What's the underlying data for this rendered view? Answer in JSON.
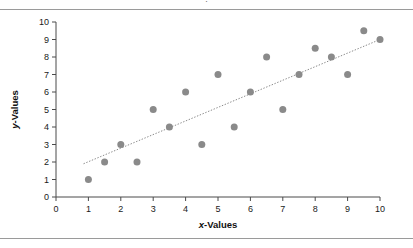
{
  "figure": {
    "clipped_header_text": "·",
    "background_color": "#ffffff",
    "rule_color": "#9a9a9a"
  },
  "chart_data": {
    "type": "scatter",
    "title": "",
    "subtitle": "",
    "xlabel": "x-Values",
    "ylabel": "y-Values",
    "xlabel_parts": {
      "italic": "x",
      "rest": "-Values"
    },
    "ylabel_parts": {
      "italic": "y",
      "rest": "-Values"
    },
    "xlim": [
      0,
      10
    ],
    "ylim": [
      0,
      10
    ],
    "xticks": [
      0,
      1,
      2,
      3,
      4,
      5,
      6,
      7,
      8,
      9,
      10
    ],
    "yticks": [
      0,
      1,
      2,
      3,
      4,
      5,
      6,
      7,
      8,
      9,
      10
    ],
    "xtick_labels": [
      "0",
      "1",
      "2",
      "3",
      "4",
      "5",
      "6",
      "7",
      "8",
      "9",
      "10"
    ],
    "ytick_labels": [
      "0",
      "1",
      "2",
      "3",
      "4",
      "5",
      "6",
      "7",
      "8",
      "9",
      "10"
    ],
    "grid": false,
    "legend": false,
    "legend_position": "none",
    "marker_color": "#8a8a8a",
    "marker_size": 4.6,
    "series": [
      {
        "name": "data",
        "x": [
          1,
          1.5,
          2,
          2.5,
          3,
          3.5,
          4,
          4.5,
          5,
          5.5,
          6,
          6.5,
          7,
          7.5,
          8,
          8.5,
          9,
          9.5,
          10
        ],
        "y": [
          1,
          2,
          3,
          2,
          5,
          4,
          6,
          3,
          7,
          4,
          6,
          8,
          5,
          7,
          8.5,
          8,
          7,
          9.5,
          9
        ]
      }
    ],
    "trendline": {
      "style": "dotted",
      "color": "#8a8a8a",
      "x_start": 0.85,
      "y_start": 1.9,
      "x_end": 10.0,
      "y_end": 9.0
    }
  }
}
